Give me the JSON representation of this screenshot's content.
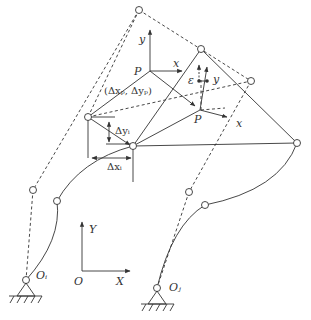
{
  "labels": {
    "frame_y_top": "y",
    "frame_P_top": "P",
    "frame_x_top": "x",
    "delta_p": "(Δxₚ, Δyₚ)",
    "delta_y": "Δyᵢ",
    "delta_x": "Δxᵢ",
    "epsilon": "ε",
    "y_right": "y",
    "P_lower": "P",
    "x_lower": "x",
    "world_Y": "Y",
    "world_X": "X",
    "world_O": "O",
    "O_i": "Oᵢ",
    "O_j": "Oⱼ"
  },
  "colors": {
    "stroke": "#333333",
    "background": "#ffffff"
  }
}
